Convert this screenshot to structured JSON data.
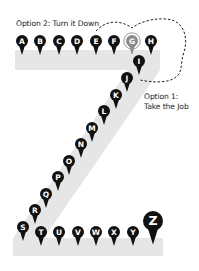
{
  "labels": {
    "option2": "Option 2:  Turn it Down",
    "option1_line1": "Option 1:",
    "option1_line2": "Take the Job"
  },
  "colors": {
    "band": "#e6e6e6",
    "pin": "#111111",
    "pin_highlight": "#8a8a8a",
    "dash": "#222222",
    "text": "#222222"
  },
  "pins": [
    {
      "letter": "A",
      "x": 22,
      "y": 41,
      "r": 6
    },
    {
      "letter": "B",
      "x": 40,
      "y": 41,
      "r": 6
    },
    {
      "letter": "C",
      "x": 59,
      "y": 41,
      "r": 6
    },
    {
      "letter": "D",
      "x": 77,
      "y": 41,
      "r": 6
    },
    {
      "letter": "E",
      "x": 96,
      "y": 41,
      "r": 6
    },
    {
      "letter": "F",
      "x": 114,
      "y": 41,
      "r": 6
    },
    {
      "letter": "G",
      "x": 132,
      "y": 41,
      "r": 6,
      "highlight": true
    },
    {
      "letter": "H",
      "x": 151,
      "y": 41,
      "r": 6
    },
    {
      "letter": "I",
      "x": 139,
      "y": 61,
      "r": 6
    },
    {
      "letter": "J",
      "x": 127,
      "y": 78,
      "r": 6
    },
    {
      "letter": "K",
      "x": 116,
      "y": 95,
      "r": 6
    },
    {
      "letter": "L",
      "x": 104,
      "y": 111,
      "r": 6
    },
    {
      "letter": "M",
      "x": 92,
      "y": 128,
      "r": 6
    },
    {
      "letter": "N",
      "x": 81,
      "y": 144,
      "r": 6
    },
    {
      "letter": "O",
      "x": 69,
      "y": 161,
      "r": 6
    },
    {
      "letter": "P",
      "x": 58,
      "y": 177,
      "r": 6
    },
    {
      "letter": "Q",
      "x": 46,
      "y": 194,
      "r": 6
    },
    {
      "letter": "R",
      "x": 35,
      "y": 210,
      "r": 6
    },
    {
      "letter": "S",
      "x": 23,
      "y": 227,
      "r": 6
    },
    {
      "letter": "T",
      "x": 41,
      "y": 232,
      "r": 6
    },
    {
      "letter": "U",
      "x": 59,
      "y": 232,
      "r": 6
    },
    {
      "letter": "V",
      "x": 78,
      "y": 232,
      "r": 6
    },
    {
      "letter": "W",
      "x": 96,
      "y": 232,
      "r": 6
    },
    {
      "letter": "X",
      "x": 114,
      "y": 232,
      "r": 6
    },
    {
      "letter": "Y",
      "x": 133,
      "y": 232,
      "r": 6
    },
    {
      "letter": "Z",
      "x": 153,
      "y": 221,
      "r": 10
    }
  ]
}
